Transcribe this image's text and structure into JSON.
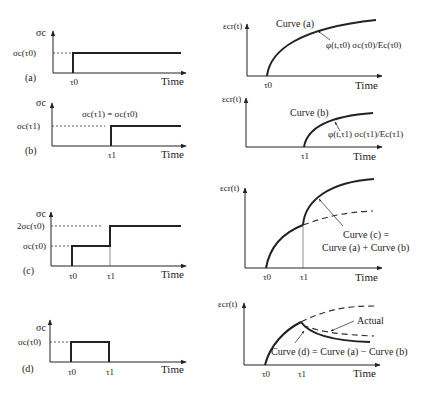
{
  "figure": {
    "panels": [
      {
        "id": "a",
        "label": "(a)",
        "stress": {
          "ylabel": "σc",
          "level_labels": [
            "σc(τ0)"
          ],
          "x_ticks": [
            "τ0"
          ],
          "xlabel": "Time"
        },
        "strain": {
          "ylabel": "εcr(t)",
          "x_ticks": [
            "τ0"
          ],
          "xlabel": "Time",
          "curve_label": "Curve (a)",
          "annotation": "φ(t,τ0) σc(τ0)/Ec(τ0)"
        }
      },
      {
        "id": "b",
        "label": "(b)",
        "stress": {
          "ylabel": "σc",
          "level_labels": [
            "σc(τ1)"
          ],
          "annotation": "σc(τ1) = σc(τ0)",
          "x_ticks": [
            "τ1"
          ],
          "xlabel": "Time"
        },
        "strain": {
          "ylabel": "εcr(t)",
          "x_ticks": [
            "τ1"
          ],
          "xlabel": "Time",
          "curve_label": "Curve (b)",
          "annotation": "φ(t,τ1) σc(τ1)/Ec(τ1)"
        }
      },
      {
        "id": "c",
        "label": "(c)",
        "stress": {
          "ylabel": "σc",
          "level_labels": [
            "2σc(τ0)",
            "σc(τ0)"
          ],
          "x_ticks": [
            "τ0",
            "τ1"
          ],
          "xlabel": "Time"
        },
        "strain": {
          "ylabel": "εcr(t)",
          "x_ticks": [
            "τ0",
            "τ1"
          ],
          "xlabel": "Time",
          "annotation_line1": "Curve (c) =",
          "annotation_line2": "Curve (a) + Curve (b)"
        }
      },
      {
        "id": "d",
        "label": "(d)",
        "stress": {
          "ylabel": "σc",
          "level_labels": [
            "σc(τ0)"
          ],
          "x_ticks": [
            "τ0",
            "τ1"
          ],
          "xlabel": "Time"
        },
        "strain": {
          "ylabel": "εcr(t)",
          "x_ticks": [
            "τ0",
            "τ1"
          ],
          "xlabel": "Time",
          "actual_label": "Actual",
          "annotation": "Curve (d) = Curve (a) − Curve (b)"
        }
      }
    ]
  }
}
